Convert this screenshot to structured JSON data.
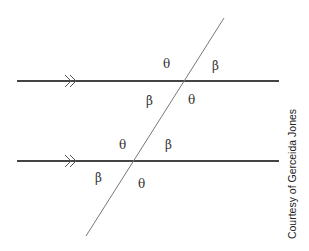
{
  "diagram": {
    "upper_intersection_labels": {
      "top_left": "θ",
      "top_right": "β",
      "bottom_left": "β",
      "bottom_right": "θ"
    },
    "lower_intersection_labels": {
      "top_left": "θ",
      "top_right": "β",
      "bottom_left": "β",
      "bottom_right": "θ"
    },
    "parallel_marker": "»",
    "colors": {
      "parallel_line": "#444444",
      "transversal": "#777777",
      "text": "#333333"
    }
  },
  "credit": "Courtesy of Gerceida Jones"
}
